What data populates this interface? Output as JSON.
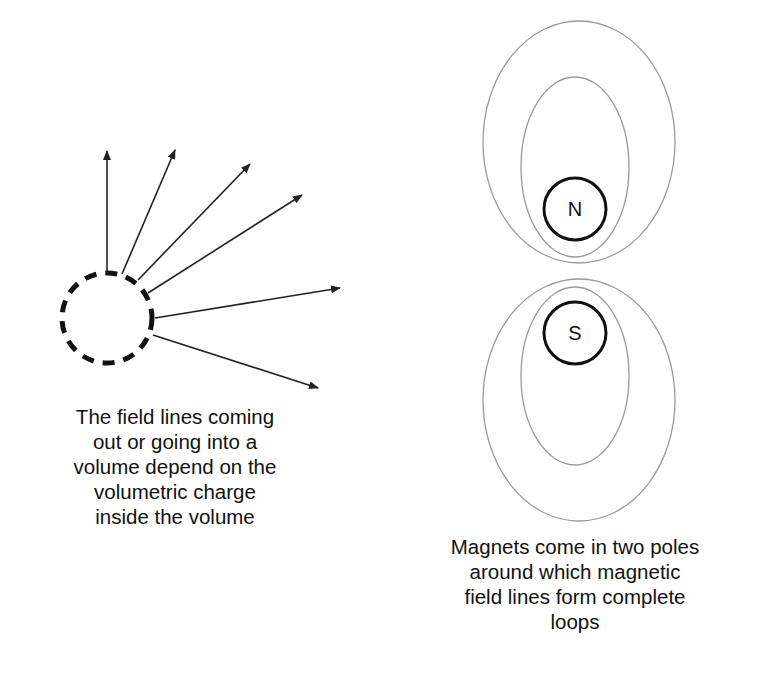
{
  "left_panel": {
    "title": "Electric field lines from a volume",
    "caption": "The field lines coming\nout or going into a\nvolume depend on the\nvolumetric charge\ninside the volume",
    "volume": {
      "shape": "dashed-circle",
      "cx": 107,
      "cy": 318,
      "r": 45
    },
    "field_lines": [
      {
        "x1": 107,
        "y1": 273,
        "x2": 107,
        "y2": 151
      },
      {
        "x1": 122,
        "y1": 274,
        "x2": 175,
        "y2": 150
      },
      {
        "x1": 138,
        "y1": 280,
        "x2": 250,
        "y2": 164
      },
      {
        "x1": 148,
        "y1": 293,
        "x2": 302,
        "y2": 195
      },
      {
        "x1": 155,
        "y1": 318,
        "x2": 340,
        "y2": 288
      },
      {
        "x1": 153,
        "y1": 335,
        "x2": 318,
        "y2": 388
      }
    ]
  },
  "right_panel": {
    "title": "Magnetic dipole field loops",
    "caption": "Magnets come in two poles\naround which magnetic\nfield lines form complete\nloops",
    "north_pole": {
      "label": "N",
      "cx": 575,
      "cy": 209,
      "r": 31
    },
    "south_pole": {
      "label": "S",
      "cx": 575,
      "cy": 333,
      "r": 31
    },
    "loops": [
      {
        "cx": 579,
        "cy": 142,
        "rx": 96,
        "ry": 121
      },
      {
        "cx": 575,
        "cy": 167,
        "rx": 54,
        "ry": 90
      },
      {
        "cx": 579,
        "cy": 400,
        "rx": 96,
        "ry": 121
      },
      {
        "cx": 575,
        "cy": 376,
        "rx": 54,
        "ry": 89
      }
    ]
  },
  "colors": {
    "line": "#222222",
    "loop": "#9a9a9a",
    "pole": "#111111",
    "background": "#ffffff"
  }
}
